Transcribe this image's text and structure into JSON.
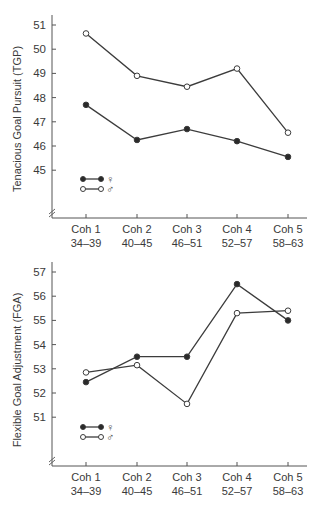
{
  "chart_data": [
    {
      "type": "line",
      "title": "",
      "ylabel": "Tenacious Goal Pursuit (TGP)",
      "xlabel": "",
      "categories": [
        "Coh 1",
        "Coh 2",
        "Coh 3",
        "Coh 4",
        "Coh 5"
      ],
      "category_sublabels": [
        "34–39",
        "40–45",
        "46–51",
        "52–57",
        "58–63"
      ],
      "yticks": [
        45,
        46,
        47,
        48,
        49,
        50,
        51
      ],
      "ylim": [
        44,
        51.4
      ],
      "axis_break": true,
      "grid": false,
      "legend_position": "lower-left",
      "series": [
        {
          "name": "♀",
          "marker": "filled-circle",
          "values": [
            47.7,
            46.25,
            46.7,
            46.2,
            45.55
          ]
        },
        {
          "name": "♂",
          "marker": "open-circle",
          "values": [
            50.65,
            48.9,
            48.45,
            49.2,
            46.55
          ]
        }
      ]
    },
    {
      "type": "line",
      "title": "",
      "ylabel": "Flexible Goal Adjustment (FGA)",
      "xlabel": "",
      "categories": [
        "Coh 1",
        "Coh 2",
        "Coh 3",
        "Coh 4",
        "Coh 5"
      ],
      "category_sublabels": [
        "34–39",
        "40–45",
        "46–51",
        "52–57",
        "58–63"
      ],
      "yticks": [
        51,
        52,
        53,
        54,
        55,
        56,
        57
      ],
      "ylim": [
        50,
        57.4
      ],
      "axis_break": true,
      "grid": false,
      "legend_position": "lower-left",
      "series": [
        {
          "name": "♀",
          "marker": "filled-circle",
          "values": [
            52.45,
            53.5,
            53.5,
            56.5,
            55.0
          ]
        },
        {
          "name": "♂",
          "marker": "open-circle",
          "values": [
            52.85,
            53.15,
            51.55,
            55.3,
            55.4
          ]
        }
      ]
    }
  ],
  "style": {
    "line_color": "#3c3c3c",
    "axis_color": "#555555",
    "marker_fill_filled": "#2a2a2a",
    "marker_fill_open": "#ffffff"
  }
}
